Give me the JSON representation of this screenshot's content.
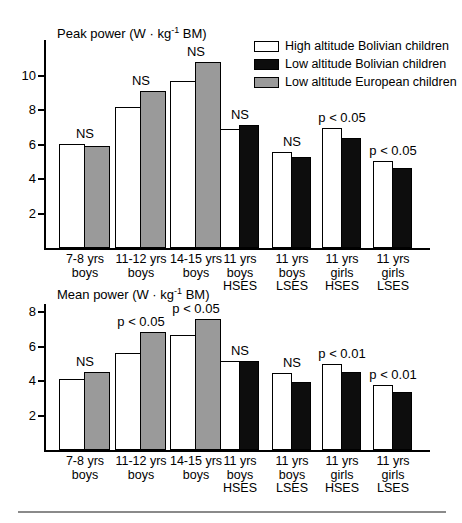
{
  "figure": {
    "background": "#ffffff",
    "bar_border_color": "#000000"
  },
  "legend": {
    "position": "top-right",
    "items": [
      {
        "label": "High altitude Bolivian children",
        "fill": "#ffffff"
      },
      {
        "label": "Low altitude Bolivian children",
        "fill": "#0d0d0d"
      },
      {
        "label": "Low altitude European children",
        "fill": "#9a9a9a"
      }
    ]
  },
  "chart_data": [
    {
      "type": "bar",
      "title": "Peak power (W · kg⁻¹ BM)",
      "title_parts": {
        "pre": "Peak power (W · kg",
        "sup": "-1",
        "post": " BM)"
      },
      "xlabel": "",
      "ylabel": "W · kg⁻¹ BM",
      "ylim": [
        0,
        12
      ],
      "yticks": [
        2,
        4,
        6,
        8,
        10
      ],
      "grid": false,
      "legend_position": "top-right",
      "categories": [
        "7-8 yrs\nboys",
        "11-12 yrs\nboys",
        "14-15 yrs\nboys",
        "11 yrs\nboys\nHSES",
        "11 yrs\nboys\nLSES",
        "11 yrs\ngirls\nHSES",
        "11 yrs\ngirls\nLSES"
      ],
      "series": [
        {
          "name": "High altitude Bolivian children",
          "values": [
            6.05,
            8.2,
            9.7,
            6.9,
            5.55,
            6.95,
            5.05
          ]
        },
        {
          "name": "Low altitude Bolivian children",
          "values": [
            null,
            null,
            null,
            7.15,
            5.3,
            6.4,
            4.65
          ]
        },
        {
          "name": "Low altitude European children",
          "values": [
            5.9,
            9.1,
            10.8,
            null,
            null,
            null,
            null
          ]
        }
      ],
      "significance": [
        "NS",
        "NS",
        "NS",
        "NS",
        "NS",
        "p < 0.05",
        "p < 0.05"
      ]
    },
    {
      "type": "bar",
      "title": "Mean power (W · kg⁻¹ BM)",
      "title_parts": {
        "pre": "Mean power (W · kg",
        "sup": "-1",
        "post": " BM)"
      },
      "xlabel": "",
      "ylabel": "W · kg⁻¹ BM",
      "ylim": [
        0,
        8.5
      ],
      "yticks": [
        2,
        4,
        6,
        8
      ],
      "grid": false,
      "legend_position": "none",
      "categories": [
        "7-8 yrs\nboys",
        "11-12 yrs\nboys",
        "14-15 yrs\nboys",
        "11 yrs\nboys\nHSES",
        "11 yrs\nboys\nLSES",
        "11 yrs\ngirls\nHSES",
        "11 yrs\ngirls\nLSES"
      ],
      "series": [
        {
          "name": "High altitude Bolivian children",
          "values": [
            4.1,
            5.65,
            6.7,
            5.15,
            4.45,
            5.0,
            3.8
          ]
        },
        {
          "name": "Low altitude Bolivian children",
          "values": [
            null,
            null,
            null,
            5.15,
            3.95,
            4.55,
            3.4
          ]
        },
        {
          "name": "Low altitude European children",
          "values": [
            4.55,
            6.85,
            7.6,
            null,
            null,
            null,
            null
          ]
        }
      ],
      "significance": [
        "NS",
        "p < 0.05",
        "p < 0.05",
        "NS",
        "NS",
        "p < 0.01",
        "p < 0.01"
      ]
    }
  ]
}
